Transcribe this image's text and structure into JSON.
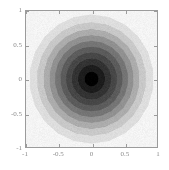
{
  "chart_data": {
    "type": "heatmap",
    "title": "",
    "subtitle": "",
    "xlabel": "",
    "ylabel": "",
    "xlim": [
      -1,
      1
    ],
    "ylim": [
      -1,
      1
    ],
    "grid": false,
    "legend": null,
    "colormap": "grayscale-reversed",
    "x_ticks": [
      -1,
      -0.5,
      0,
      0.5,
      1
    ],
    "x_tick_labels": [
      "-1",
      "-0.5",
      "0",
      "0.5",
      "1"
    ],
    "y_ticks": [
      -1,
      -0.5,
      0,
      0.5,
      1
    ],
    "y_tick_labels": [
      "-1",
      "-0.5",
      "0",
      "0.5",
      "1"
    ],
    "center": [
      0,
      0
    ],
    "n_levels": 10,
    "levels": [
      0.0,
      0.1,
      0.2,
      0.3,
      0.4,
      0.5,
      0.6,
      0.7,
      0.8,
      0.9,
      1.0
    ],
    "level_radii": [
      0.105,
      0.205,
      0.3,
      0.39,
      0.475,
      0.56,
      0.645,
      0.735,
      0.835,
      0.95
    ],
    "level_colors": [
      "#000000",
      "#1d1d1d",
      "#333333",
      "#474747",
      "#5c5c5c",
      "#757575",
      "#919191",
      "#acacac",
      "#c8c8c8",
      "#dedede",
      "#f4f4f4"
    ],
    "band_values": [
      1.0,
      0.9,
      0.8,
      0.7,
      0.6,
      0.5,
      0.4,
      0.3,
      0.2,
      0.1,
      0.0
    ],
    "contour_sides": 22,
    "frame_color": "#9b9b9b",
    "tick_label_color": "#8c8c8c",
    "background_color": "#ffffff"
  },
  "axes": {
    "x": {
      "ticks": [
        {
          "value": -1,
          "label": "-1"
        },
        {
          "value": -0.5,
          "label": "-0.5"
        },
        {
          "value": 0,
          "label": "0"
        },
        {
          "value": 0.5,
          "label": "0.5"
        },
        {
          "value": 1,
          "label": "1"
        }
      ]
    },
    "y": {
      "ticks": [
        {
          "value": 1,
          "label": "1"
        },
        {
          "value": 0.5,
          "label": "0.5"
        },
        {
          "value": 0,
          "label": "0"
        },
        {
          "value": -0.5,
          "label": "-0.5"
        },
        {
          "value": -1,
          "label": "-1"
        }
      ]
    }
  }
}
